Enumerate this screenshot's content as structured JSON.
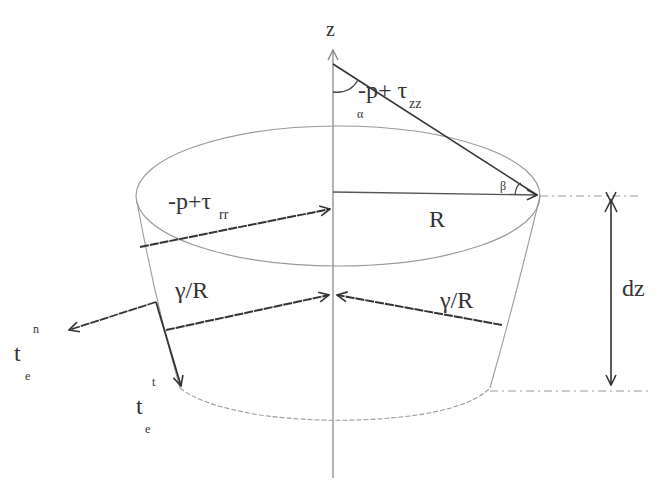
{
  "diagram": {
    "labels": {
      "axis_z": "z",
      "normal_stress_zz_main": "-p+ τ",
      "normal_stress_zz_sub": "zz",
      "angle_alpha": "α",
      "angle_beta": "β",
      "radial_stress_main": "-p+τ",
      "radial_stress_sub": "rr",
      "radius": "R",
      "surface_tension_left": "γ/R",
      "surface_tension_right": "γ/R",
      "height": "dz",
      "normal_vector_main": "t",
      "normal_vector_sub": "e",
      "normal_vector_sup": "n",
      "tangent_vector_main": "t",
      "tangent_vector_sub": "e",
      "tangent_vector_sup": "t"
    },
    "colors": {
      "line_dark": "#333333",
      "line_light": "#9a9a9a",
      "background": "#ffffff"
    }
  }
}
